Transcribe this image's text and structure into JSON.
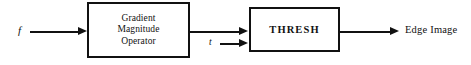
{
  "diagram": {
    "background_color": "#ffffff",
    "stroke_color": "#111111",
    "inputs": [
      {
        "name": "f",
        "label": "f"
      },
      {
        "name": "t",
        "label": "t"
      }
    ],
    "blocks": [
      {
        "name": "gradient-magnitude-operator",
        "lines": [
          "Gradient",
          "Magnitude",
          "Operator"
        ]
      },
      {
        "name": "thresh",
        "lines": [
          "THRESH"
        ]
      }
    ],
    "outputs": [
      {
        "name": "edge-image",
        "label": "Edge Image"
      }
    ],
    "connections": [
      {
        "name": "f-to-gradient",
        "from": "f",
        "to": "gradient-magnitude-operator"
      },
      {
        "name": "gradient-to-thresh",
        "from": "gradient-magnitude-operator",
        "to": "thresh"
      },
      {
        "name": "t-to-thresh",
        "from": "t",
        "to": "thresh"
      },
      {
        "name": "thresh-to-edge-image",
        "from": "thresh",
        "to": "edge-image"
      }
    ]
  }
}
